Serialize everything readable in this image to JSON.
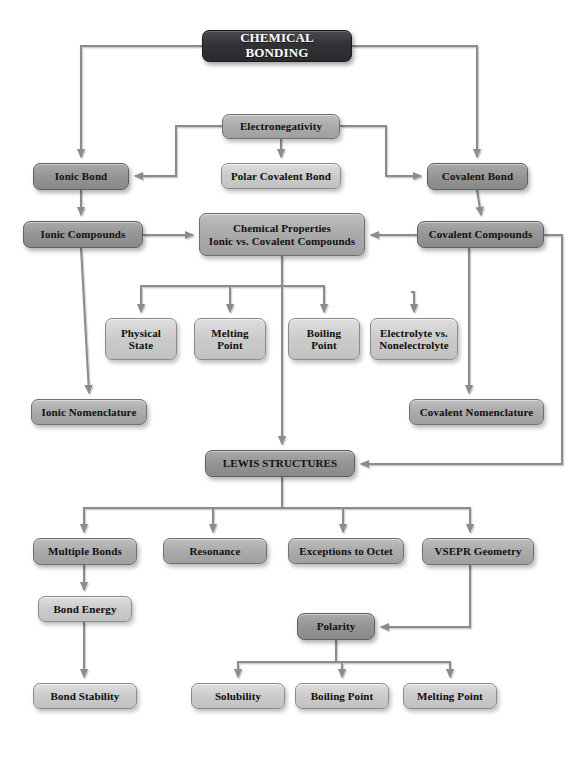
{
  "diagram": {
    "title": "CHEMICAL BONDING",
    "type": "flowchart",
    "canvas": {
      "width": 584,
      "height": 757,
      "background": "#ffffff"
    },
    "palette": {
      "title_fill": "#323236",
      "dark_fill": "#959595",
      "mid_fill": "#aaaaaa",
      "light_fill": "#cacaca",
      "edge_stroke": "#8c8c8e",
      "text_dark": "#121212",
      "text_light": "#ffffff"
    },
    "nodes": [
      {
        "id": "chemical-bonding",
        "label": "CHEMICAL BONDING",
        "tone": "title",
        "x": 202,
        "y": 30,
        "w": 150,
        "h": 32,
        "font": 13
      },
      {
        "id": "electronegativity",
        "label": "Electronegativity",
        "tone": "mid",
        "x": 222,
        "y": 114,
        "w": 118,
        "h": 25,
        "font": 11
      },
      {
        "id": "ionic-bond",
        "label": "Ionic Bond",
        "tone": "dark",
        "x": 33,
        "y": 163,
        "w": 96,
        "h": 27,
        "font": 11
      },
      {
        "id": "polar-covalent-bond",
        "label": "Polar Covalent Bond",
        "tone": "light",
        "x": 221,
        "y": 163,
        "w": 120,
        "h": 26,
        "font": 11
      },
      {
        "id": "covalent-bond",
        "label": "Covalent Bond",
        "tone": "dark",
        "x": 427,
        "y": 163,
        "w": 101,
        "h": 27,
        "font": 11
      },
      {
        "id": "ionic-compounds",
        "label": "Ionic Compounds",
        "tone": "dark",
        "x": 23,
        "y": 221,
        "w": 120,
        "h": 27,
        "font": 11
      },
      {
        "id": "chemical-properties",
        "label": "Chemical Properties\nIonic vs. Covalent Compounds",
        "tone": "mid",
        "x": 199,
        "y": 213,
        "w": 166,
        "h": 43,
        "font": 11
      },
      {
        "id": "covalent-compounds",
        "label": "Covalent Compounds",
        "tone": "dark",
        "x": 417,
        "y": 221,
        "w": 127,
        "h": 27,
        "font": 11
      },
      {
        "id": "physical-state",
        "label": "Physical\nState",
        "tone": "light",
        "x": 105,
        "y": 318,
        "w": 72,
        "h": 42,
        "font": 11
      },
      {
        "id": "melting-point-1",
        "label": "Melting\nPoint",
        "tone": "light",
        "x": 194,
        "y": 318,
        "w": 72,
        "h": 42,
        "font": 11
      },
      {
        "id": "boiling-point-1",
        "label": "Boiling\nPoint",
        "tone": "light",
        "x": 288,
        "y": 318,
        "w": 72,
        "h": 42,
        "font": 11
      },
      {
        "id": "electrolyte-vs-nonelectrolyte",
        "label": "Electrolyte vs.\nNonelectrolyte",
        "tone": "light",
        "x": 370,
        "y": 318,
        "w": 88,
        "h": 42,
        "font": 11
      },
      {
        "id": "ionic-nomenclature",
        "label": "Ionic Nomenclature",
        "tone": "mid",
        "x": 31,
        "y": 399,
        "w": 116,
        "h": 26,
        "font": 11
      },
      {
        "id": "covalent-nomenclature",
        "label": "Covalent Nomenclature",
        "tone": "mid",
        "x": 409,
        "y": 399,
        "w": 135,
        "h": 26,
        "font": 11
      },
      {
        "id": "lewis-structures",
        "label": "LEWIS STRUCTURES",
        "tone": "dark",
        "x": 205,
        "y": 450,
        "w": 150,
        "h": 27,
        "font": 11
      },
      {
        "id": "multiple-bonds",
        "label": "Multiple Bonds",
        "tone": "mid",
        "x": 33,
        "y": 538,
        "w": 104,
        "h": 27,
        "font": 11
      },
      {
        "id": "resonance",
        "label": "Resonance",
        "tone": "mid",
        "x": 163,
        "y": 538,
        "w": 104,
        "h": 26,
        "font": 11
      },
      {
        "id": "exceptions-to-octet",
        "label": "Exceptions to Octet",
        "tone": "mid",
        "x": 288,
        "y": 538,
        "w": 116,
        "h": 26,
        "font": 11
      },
      {
        "id": "vsepr-geometry",
        "label": "VSEPR Geometry",
        "tone": "mid",
        "x": 422,
        "y": 538,
        "w": 112,
        "h": 27,
        "font": 11
      },
      {
        "id": "bond-energy",
        "label": "Bond Energy",
        "tone": "light",
        "x": 38,
        "y": 596,
        "w": 94,
        "h": 26,
        "font": 11
      },
      {
        "id": "polarity",
        "label": "Polarity",
        "tone": "dark",
        "x": 297,
        "y": 613,
        "w": 78,
        "h": 27,
        "font": 11
      },
      {
        "id": "bond-stability",
        "label": "Bond Stability",
        "tone": "light",
        "x": 33,
        "y": 683,
        "w": 104,
        "h": 26,
        "font": 11
      },
      {
        "id": "solubility",
        "label": "Solubility",
        "tone": "light",
        "x": 191,
        "y": 683,
        "w": 94,
        "h": 26,
        "font": 11
      },
      {
        "id": "boiling-point-2",
        "label": "Boiling Point",
        "tone": "light",
        "x": 295,
        "y": 683,
        "w": 94,
        "h": 26,
        "font": 11
      },
      {
        "id": "melting-point-2",
        "label": "Melting Point",
        "tone": "light",
        "x": 403,
        "y": 683,
        "w": 94,
        "h": 26,
        "font": 11
      }
    ],
    "edges": [
      {
        "id": "bonding-to-ionic-bond",
        "from": "chemical-bonding",
        "to": "ionic-bond",
        "path": "M202,46 L81,46 L81,157",
        "arrow": "down"
      },
      {
        "id": "bonding-to-covalent-bond",
        "from": "chemical-bonding",
        "to": "covalent-bond",
        "path": "M352,46 L477,46 L477,157",
        "arrow": "down"
      },
      {
        "id": "electroneg-to-ionic-bond",
        "from": "electronegativity",
        "to": "ionic-bond",
        "path": "M222,126 L176,126 L176,176 L135,176",
        "arrow": "left"
      },
      {
        "id": "electroneg-to-polar",
        "from": "electronegativity",
        "to": "polar-covalent-bond",
        "path": "M281,139 L281,157",
        "arrow": "down"
      },
      {
        "id": "electroneg-to-covalent-bond",
        "from": "electronegativity",
        "to": "covalent-bond",
        "path": "M340,126 L386,126 L386,176 L421,176",
        "arrow": "right"
      },
      {
        "id": "ionic-bond-to-compounds",
        "from": "ionic-bond",
        "to": "ionic-compounds",
        "path": "M81,190 L81,215",
        "arrow": "down"
      },
      {
        "id": "covalent-bond-to-compounds",
        "from": "covalent-bond",
        "to": "covalent-compounds",
        "path": "M477,190 L481,215",
        "arrow": "down"
      },
      {
        "id": "ionic-comp-to-properties",
        "from": "ionic-compounds",
        "to": "chemical-properties",
        "path": "M143,235 L193,235",
        "arrow": "right"
      },
      {
        "id": "covalent-comp-to-properties",
        "from": "covalent-compounds",
        "to": "chemical-properties",
        "path": "M417,235 L371,235",
        "arrow": "left"
      },
      {
        "id": "properties-to-fanout",
        "from": "chemical-properties",
        "to": "physical-state",
        "path": "M282,256 L282,286 L141,286 L141,312",
        "arrow": "down"
      },
      {
        "id": "properties-to-melting",
        "from": "chemical-properties",
        "to": "melting-point-1",
        "path": "M282,286 L230,286 L230,312",
        "arrow": "down"
      },
      {
        "id": "properties-to-boiling",
        "from": "chemical-properties",
        "to": "boiling-point-1",
        "path": "M282,286 L324,286 L324,312",
        "arrow": "down"
      },
      {
        "id": "covalent-comp-to-electrolyte",
        "from": "covalent-compounds",
        "to": "electrolyte-vs-nonelectrolyte",
        "path": "M411,292 L414,292 L414,312",
        "arrow": "down"
      },
      {
        "id": "ionic-comp-to-nomenclature",
        "from": "ionic-compounds",
        "to": "ionic-nomenclature",
        "path": "M81,248 L89,393",
        "arrow": "down"
      },
      {
        "id": "covalent-comp-to-nomenclature",
        "from": "covalent-compounds",
        "to": "covalent-nomenclature",
        "path": "M469,248 L469,393",
        "arrow": "down"
      },
      {
        "id": "properties-chain-to-lewis",
        "from": "chemical-properties",
        "to": "lewis-structures",
        "path": "M282,256 L282,444",
        "arrow": "down"
      },
      {
        "id": "covalent-comp-right-to-lewis",
        "from": "covalent-compounds",
        "to": "lewis-structures",
        "path": "M544,235 L562,235 L562,464 L361,464",
        "arrow": "left"
      },
      {
        "id": "lewis-to-multiple-bonds",
        "from": "lewis-structures",
        "to": "multiple-bonds",
        "path": "M282,477 L282,508 L84,508 L84,532",
        "arrow": "down"
      },
      {
        "id": "lewis-to-resonance",
        "from": "lewis-structures",
        "to": "resonance",
        "path": "M282,508 L213,508 L213,532",
        "arrow": "down"
      },
      {
        "id": "lewis-to-exceptions",
        "from": "lewis-structures",
        "to": "exceptions-to-octet",
        "path": "M282,508 L343,508 L343,532",
        "arrow": "down"
      },
      {
        "id": "lewis-to-vsepr",
        "from": "lewis-structures",
        "to": "vsepr-geometry",
        "path": "M282,508 L470,508 L470,532",
        "arrow": "down"
      },
      {
        "id": "multiple-bonds-to-energy",
        "from": "multiple-bonds",
        "to": "bond-energy",
        "path": "M84,565 L84,590",
        "arrow": "down"
      },
      {
        "id": "energy-to-stability",
        "from": "bond-energy",
        "to": "bond-stability",
        "path": "M84,622 L84,677",
        "arrow": "down"
      },
      {
        "id": "vsepr-to-polarity",
        "from": "vsepr-geometry",
        "to": "polarity",
        "path": "M470,565 L470,627 L381,627",
        "arrow": "left"
      },
      {
        "id": "polarity-to-solubility",
        "from": "polarity",
        "to": "solubility",
        "path": "M336,640 L336,662 L238,662 L238,677",
        "arrow": "down"
      },
      {
        "id": "polarity-to-boiling",
        "from": "polarity",
        "to": "boiling-point-2",
        "path": "M336,662 L342,662 L342,677",
        "arrow": "down"
      },
      {
        "id": "polarity-to-melting",
        "from": "polarity",
        "to": "melting-point-2",
        "path": "M336,662 L450,662 L450,677",
        "arrow": "down"
      }
    ]
  }
}
